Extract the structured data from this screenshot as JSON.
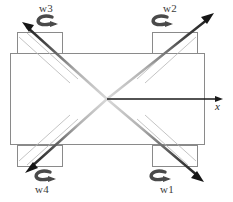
{
  "figure": {
    "type": "schematic-diagram",
    "background_color": "#ffffff",
    "width": 233,
    "height": 202
  },
  "body": {
    "name": "main-frame-rectangle",
    "stroke_color": "#8a8a8a",
    "fill_color": "#ffffff",
    "x": 10,
    "y": 53,
    "width": 195,
    "height": 92
  },
  "rotors": [
    {
      "id": "rotor-w1",
      "label": "w1",
      "corner": "bottom-right",
      "box": {
        "x": 152,
        "y": 145,
        "width": 46,
        "height": 21
      },
      "spin_symbol": "curved-arrow-clockwise",
      "label_x": 160,
      "label_y": 185,
      "spin_x": 145,
      "spin_y": 168
    },
    {
      "id": "rotor-w2",
      "label": "w2",
      "corner": "top-right",
      "box": {
        "x": 152,
        "y": 32,
        "width": 46,
        "height": 21
      },
      "spin_symbol": "curved-arrow-clockwise",
      "label_x": 163,
      "label_y": 4,
      "spin_x": 147,
      "spin_y": 15
    },
    {
      "id": "rotor-w3",
      "label": "w3",
      "corner": "top-left",
      "box": {
        "x": 17,
        "y": 32,
        "width": 46,
        "height": 21
      },
      "spin_symbol": "curved-arrow-clockwise",
      "label_x": 39,
      "label_y": 4,
      "spin_x": 32,
      "spin_y": 15
    },
    {
      "id": "rotor-w4",
      "label": "w4",
      "corner": "bottom-left",
      "box": {
        "x": 17,
        "y": 145,
        "width": 46,
        "height": 21
      },
      "spin_symbol": "curved-arrow-clockwise",
      "label_x": 35,
      "label_y": 185,
      "spin_x": 30,
      "spin_y": 168
    }
  ],
  "axis": {
    "name": "x-axis",
    "label": "x",
    "origin_x": 107,
    "origin_y": 99,
    "tip_x": 222,
    "tip_y": 99,
    "label_x": 216,
    "label_y": 103,
    "stroke_color": "#1a1a1a"
  },
  "thrust_arrows": [
    {
      "id": "thrust-arrow-w2",
      "from": "center",
      "direction": "up-right",
      "start_x": 107,
      "start_y": 99,
      "end_x": 213,
      "end_y": 14,
      "stroke_color": "#2b2b2b",
      "gradient": "light-to-dark"
    },
    {
      "id": "thrust-arrow-w3",
      "from": "center",
      "direction": "up-left",
      "start_x": 107,
      "start_y": 99,
      "end_x": 22,
      "end_y": 22,
      "stroke_color": "#2b2b2b",
      "gradient": "light-to-dark",
      "reversed": true
    },
    {
      "id": "thrust-arrow-w1",
      "from": "center",
      "direction": "down-right",
      "start_x": 107,
      "start_y": 99,
      "end_x": 203,
      "end_y": 181,
      "stroke_color": "#2b2b2b",
      "gradient": "light-to-dark"
    },
    {
      "id": "thrust-arrow-w4",
      "from": "center",
      "direction": "down-left",
      "start_x": 107,
      "start_y": 99,
      "end_x": 26,
      "end_y": 172,
      "stroke_color": "#2b2b2b",
      "gradient": "light-to-dark",
      "reversed": true
    }
  ],
  "colors": {
    "frame_stroke": "#8a8a8a",
    "rotor_stroke": "#8a8a8a",
    "arrow_dark": "#1f1f1f",
    "arrow_light": "#c9c9c9",
    "spin_arrow": "#4a4a4a",
    "text": "#3b3b3b"
  }
}
